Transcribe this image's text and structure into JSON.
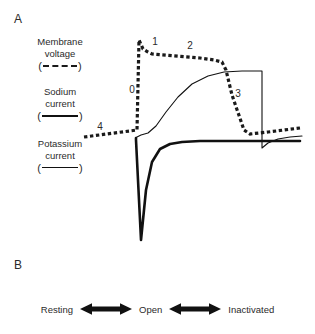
{
  "figure": {
    "panel_a_letter": "A",
    "panel_b_letter": "B"
  },
  "legend": {
    "membrane": {
      "line1": "Membrane",
      "line2": "voltage",
      "open_paren": "(",
      "close_paren": ")",
      "style": "dashed"
    },
    "sodium": {
      "line1": "Sodium",
      "line2": "current",
      "open_paren": "(",
      "close_paren": ")",
      "style": "thick-solid"
    },
    "potassium": {
      "line1": "Potassium",
      "line2": "current",
      "open_paren": "(",
      "close_paren": ")",
      "style": "thin-solid"
    }
  },
  "phases": [
    {
      "id": "0",
      "label": "0",
      "x": 132,
      "y": 93
    },
    {
      "id": "1",
      "label": "1",
      "x": 155,
      "y": 45
    },
    {
      "id": "2",
      "label": "2",
      "x": 190,
      "y": 49
    },
    {
      "id": "3",
      "label": "3",
      "x": 238,
      "y": 97
    },
    {
      "id": "4",
      "label": "4",
      "x": 100,
      "y": 130
    }
  ],
  "panel_b": {
    "states": [
      "Resting",
      "Open",
      "Inactivated"
    ],
    "arrow_name": "double-headed-arrow"
  },
  "colors": {
    "ink": "#111111",
    "text": "#2b2b2b",
    "background": "#ffffff"
  },
  "chart_data": {
    "type": "line",
    "title": "",
    "xlabel": "",
    "ylabel": "",
    "series": [
      {
        "name": "Membrane voltage",
        "style": "dashed",
        "path": "M 84,137 L 137,130 L 139,40 L 143,49 L 148,52 L 152,54 L 200,58 L 214,60 L 222,62 L 226,70 L 232,95 L 244,130 L 250,134 L 268,132 L 300,128"
      },
      {
        "name": "Sodium current",
        "style": "thick-solid",
        "path": "M 136,138 L 136,140 L 141,240 L 146,190 L 152,162 L 160,149 L 170,144 L 182,142 L 200,141 L 240,141 L 300,141"
      },
      {
        "name": "Potassium current",
        "style": "thin-solid",
        "path": "M 136,138 L 137,137 L 141,135 L 148,133 L 156,126 L 166,112 L 178,97 L 192,84 L 208,76 L 224,72 L 242,71 L 262,71 L 262,148 L 268,143 L 278,139 L 290,137 L 302,136"
      }
    ],
    "annotations": [
      {
        "text": "0",
        "x": 132,
        "y": 93
      },
      {
        "text": "1",
        "x": 155,
        "y": 45
      },
      {
        "text": "2",
        "x": 190,
        "y": 49
      },
      {
        "text": "3",
        "x": 238,
        "y": 97
      },
      {
        "text": "4",
        "x": 100,
        "y": 130
      }
    ],
    "baseline_y": 141,
    "grid": false,
    "legend_position": "left"
  }
}
